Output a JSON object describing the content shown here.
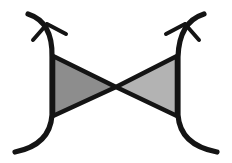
{
  "figure": {
    "title": "Bowtie diagram with curved side arcs and arrowheads",
    "width": 232,
    "height": 163,
    "background_color": "#ffffff",
    "stroke_color": "#141414",
    "left_triangle_fill": "#8d8d8d",
    "right_triangle_fill": "#b3b3b3",
    "stroke_width_curve": 5.2,
    "stroke_width_triangle": 4.6,
    "stroke_width_arrow": 4.0
  },
  "geometry": {
    "left_arc": {
      "label": "left-curve",
      "top_point": [
        28,
        14
      ],
      "control_top": [
        53,
        22
      ],
      "waist_upper": [
        52,
        57
      ],
      "waist_lower": [
        52,
        115
      ],
      "control_bottom": [
        50,
        145
      ],
      "bottom_point": [
        15,
        152
      ],
      "bow_direction": "outward-left"
    },
    "right_arc": {
      "label": "right-curve",
      "top_point": [
        204,
        14
      ],
      "control_top": [
        179,
        22
      ],
      "waist_upper": [
        178,
        57
      ],
      "waist_lower": [
        178,
        115
      ],
      "control_bottom": [
        180,
        145
      ],
      "bottom_point": [
        217,
        152
      ],
      "bow_direction": "outward-right"
    },
    "left_triangle": {
      "label": "left-shaded-triangle",
      "points": [
        [
          53,
          56
        ],
        [
          53,
          116
        ],
        [
          116,
          87
        ]
      ],
      "fill": "#8d8d8d"
    },
    "right_triangle": {
      "label": "right-shaded-triangle",
      "points": [
        [
          177,
          56
        ],
        [
          177,
          116
        ],
        [
          116,
          87
        ]
      ],
      "fill": "#b3b3b3"
    },
    "center_crossing": [
      116,
      87
    ],
    "left_arrowhead": {
      "label": "left-arrowhead",
      "tip": [
        47,
        24
      ],
      "barb_outer": [
        33,
        40
      ],
      "barb_inner": [
        66,
        34
      ]
    },
    "right_arrowhead": {
      "label": "right-arrowhead",
      "tip": [
        185,
        24
      ],
      "barb_outer": [
        199,
        40
      ],
      "barb_inner": [
        166,
        34
      ]
    }
  }
}
